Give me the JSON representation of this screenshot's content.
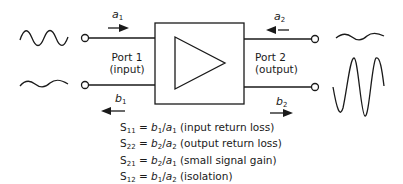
{
  "diagram": {
    "type": "two-port amplifier S-parameter diagram",
    "port1": {
      "title": "Port 1",
      "subtitle": "(input)"
    },
    "port2": {
      "title": "Port 2",
      "subtitle": "(output)"
    },
    "waves": {
      "a1": {
        "letter": "a",
        "sub": "1",
        "direction": "right"
      },
      "b1": {
        "letter": "b",
        "sub": "1",
        "direction": "left"
      },
      "a2": {
        "letter": "a",
        "sub": "2",
        "direction": "left"
      },
      "b2": {
        "letter": "b",
        "sub": "2",
        "direction": "right"
      }
    },
    "equations": [
      {
        "s": "S",
        "s_sub": "11",
        "num": "b",
        "num_sub": "1",
        "den": "a",
        "den_sub": "1",
        "desc": "(input return loss)"
      },
      {
        "s": "S",
        "s_sub": "22",
        "num": "b",
        "num_sub": "2",
        "den": "a",
        "den_sub": "2",
        "desc": "(output return loss)"
      },
      {
        "s": "S",
        "s_sub": "21",
        "num": "b",
        "num_sub": "2",
        "den": "a",
        "den_sub": "1",
        "desc": "(small signal gain)"
      },
      {
        "s": "S",
        "s_sub": "12",
        "num": "b",
        "num_sub": "1",
        "den": "a",
        "den_sub": "2",
        "desc": "(isolation)"
      }
    ],
    "colors": {
      "stroke": "#1a1a1a",
      "background": "#ffffff"
    }
  }
}
